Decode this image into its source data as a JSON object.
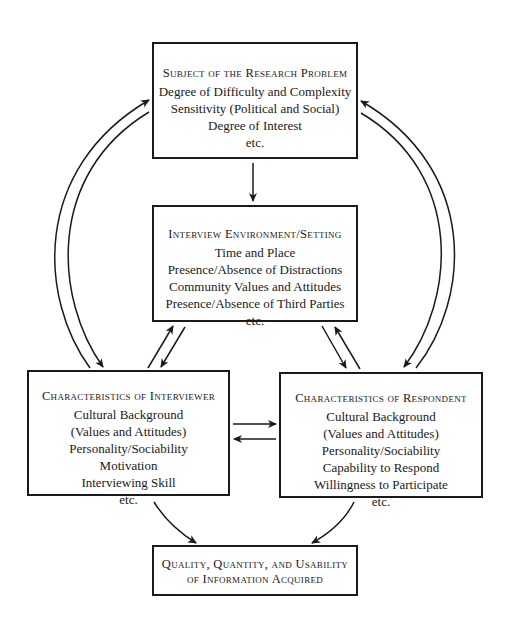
{
  "diagram": {
    "nodes": {
      "subject": {
        "title": "Subject of the Research Problem",
        "lines": [
          "Degree of Difficulty and Complexity",
          "Sensitivity (Political and Social)",
          "Degree of Interest",
          "etc."
        ]
      },
      "environment": {
        "title": "Interview Environment/Setting",
        "lines": [
          "Time and Place",
          "Presence/Absence of Distractions",
          "Community Values and Attitudes",
          "Presence/Absence of Third Parties",
          "etc."
        ]
      },
      "interviewer": {
        "title": "Characteristics of Interviewer",
        "lines": [
          "Cultural Background",
          "(Values and Attitudes)",
          "Personality/Sociability",
          "Motivation",
          "Interviewing Skill",
          "etc."
        ]
      },
      "respondent": {
        "title": "Characteristics of Respondent",
        "lines": [
          "Cultural Background",
          "(Values and Attitudes)",
          "Personality/Sociability",
          "Capability to Respond",
          "Willingness to Participate",
          "etc."
        ]
      },
      "outcome": {
        "title_line1": "Quality, Quantity, and Usability",
        "title_line2": "of Information Acquired"
      }
    },
    "edges": [
      {
        "from": "subject",
        "to": "environment"
      },
      {
        "from": "interviewer",
        "to": "subject"
      },
      {
        "from": "subject",
        "to": "interviewer"
      },
      {
        "from": "respondent",
        "to": "subject"
      },
      {
        "from": "subject",
        "to": "respondent"
      },
      {
        "from": "interviewer",
        "to": "environment"
      },
      {
        "from": "environment",
        "to": "interviewer"
      },
      {
        "from": "environment",
        "to": "respondent"
      },
      {
        "from": "respondent",
        "to": "environment"
      },
      {
        "from": "interviewer",
        "to": "respondent"
      },
      {
        "from": "respondent",
        "to": "interviewer"
      },
      {
        "from": "interviewer",
        "to": "outcome"
      },
      {
        "from": "respondent",
        "to": "outcome"
      }
    ],
    "colors": {
      "ink": "#1a1a1a",
      "background": "#ffffff"
    }
  }
}
